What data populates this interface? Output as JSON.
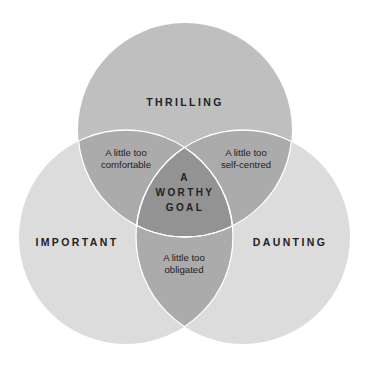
{
  "diagram": {
    "type": "venn-3",
    "colors": {
      "background": "#ffffff",
      "top_circle": "#bfbfbf",
      "side_circles": "#dcdcdc",
      "pair_overlap": "#ababab",
      "center": "#939393",
      "outline": "#ffffff",
      "text": "#222222"
    },
    "sets": [
      {
        "id": "thrilling",
        "label": "THRILLING",
        "cx": 185,
        "cy": 130,
        "r": 107
      },
      {
        "id": "important",
        "label": "IMPORTANT",
        "cx": 126,
        "cy": 237,
        "r": 107
      },
      {
        "id": "daunting",
        "label": "DAUNTING",
        "cx": 243,
        "cy": 237,
        "r": 107
      }
    ],
    "overlaps": {
      "thrilling_important": {
        "line1": "A little too",
        "line2": "comfortable"
      },
      "thrilling_daunting": {
        "line1": "A little too",
        "line2": "self-centred"
      },
      "important_daunting": {
        "line1": "A little too",
        "line2": "obligated"
      },
      "center": {
        "line1": "A",
        "line2": "WORTHY",
        "line3": "GOAL"
      }
    }
  }
}
